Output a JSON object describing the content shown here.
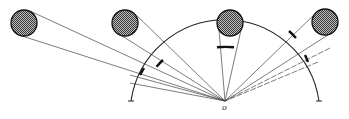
{
  "diagram": {
    "title": "",
    "center_label": "o",
    "center": {
      "x": 225,
      "y": 101
    },
    "arc_radius": 95,
    "bodies": [
      {
        "name": "body-1",
        "cx": 24,
        "cy": 23,
        "r": 13
      },
      {
        "name": "body-2",
        "cx": 125,
        "cy": 23,
        "r": 13
      },
      {
        "name": "body-3",
        "cx": 230,
        "cy": 23,
        "r": 13
      },
      {
        "name": "body-4",
        "cx": 325,
        "cy": 22,
        "r": 13
      }
    ],
    "colors": {
      "stroke": "#222222",
      "fill": "#7a7a7a",
      "background": "#ffffff"
    }
  }
}
